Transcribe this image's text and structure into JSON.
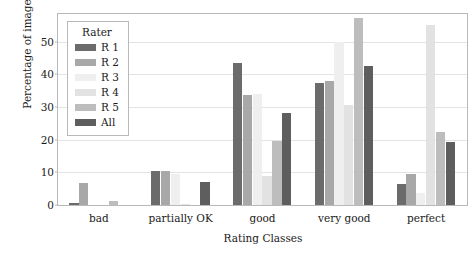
{
  "chart_data": {
    "type": "bar",
    "title": "",
    "xlabel": "Rating Classes",
    "ylabel": "Percentage of images",
    "categories": [
      "bad",
      "partially OK",
      "good",
      "very good",
      "perfect"
    ],
    "series": [
      {
        "name": "R 1",
        "color": "#6b6b6b",
        "values": [
          0.5,
          10.4,
          43.6,
          37.4,
          6.3
        ]
      },
      {
        "name": "R 2",
        "color": "#a8a8a8",
        "values": [
          6.6,
          10.4,
          33.7,
          38.1,
          9.4
        ]
      },
      {
        "name": "R 3",
        "color": "#efefef",
        "values": [
          0.0,
          9.6,
          34.1,
          49.8,
          3.7
        ]
      },
      {
        "name": "R 4",
        "color": "#e2e2e2",
        "values": [
          0.0,
          0.4,
          8.8,
          30.5,
          55.2
        ]
      },
      {
        "name": "R 5",
        "color": "#bdbdbd",
        "values": [
          1.3,
          0.0,
          19.5,
          57.2,
          22.3
        ]
      },
      {
        "name": "All",
        "color": "#5e5e5e",
        "values": [
          0.0,
          7.2,
          28.2,
          42.5,
          19.4
        ]
      }
    ],
    "ylim": [
      0,
      58.5
    ],
    "yticks": [
      0,
      10,
      20,
      30,
      40,
      50
    ],
    "ytick_labels": [
      "0",
      "10",
      "20",
      "30",
      "40",
      "50"
    ],
    "grid": "horizontal",
    "legend_position": "upper-left",
    "legend_title": "Rater"
  },
  "legend": {
    "title": "Rater",
    "entries": [
      "R 1",
      "R 2",
      "R 3",
      "R 4",
      "R 5",
      "All"
    ]
  },
  "axes": {
    "x_title": "Rating Classes",
    "y_title": "Percentage of images"
  }
}
